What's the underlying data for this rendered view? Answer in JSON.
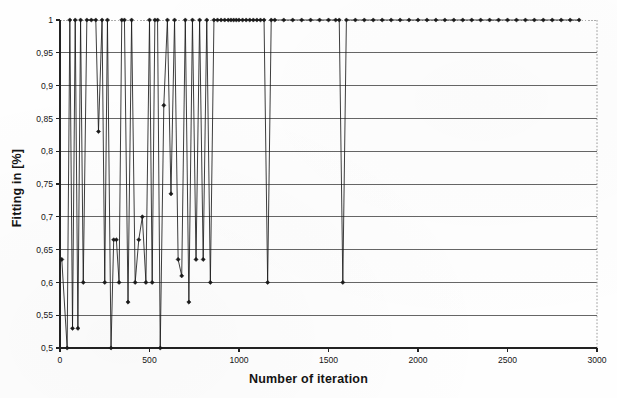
{
  "chart_data": {
    "type": "line",
    "title": "",
    "xlabel": "Number of iteration",
    "ylabel": "Fitting in [%]",
    "xlim": [
      0,
      3000
    ],
    "ylim": [
      0.5,
      1.0
    ],
    "xticks": [
      0,
      500,
      1000,
      1500,
      2000,
      2500,
      3000
    ],
    "xtick_labels": [
      "0",
      "500",
      "1000",
      "1500",
      "2000",
      "2500",
      "3000"
    ],
    "yticks": [
      0.5,
      0.55,
      0.6,
      0.65,
      0.7,
      0.75,
      0.8,
      0.85,
      0.9,
      0.95,
      1.0
    ],
    "ytick_labels": [
      "0,5",
      "0,55",
      "0,6",
      "0,65",
      "0,7",
      "0,75",
      "0,8",
      "0,85",
      "0,9",
      "0,95",
      "1"
    ],
    "decimal_separator": ",",
    "grid": "horizontal",
    "legend": "none",
    "marker": "filled-diamond",
    "line_color": "#1a1a1a",
    "grid_color": "#555555",
    "axis_color": "#222222",
    "background": "#ffffff",
    "series": [
      {
        "name": "Fitting",
        "x": [
          10,
          40,
          55,
          70,
          85,
          100,
          115,
          130,
          150,
          175,
          200,
          215,
          235,
          250,
          265,
          285,
          300,
          315,
          330,
          345,
          360,
          380,
          400,
          420,
          440,
          460,
          480,
          500,
          515,
          530,
          545,
          560,
          580,
          600,
          620,
          640,
          660,
          680,
          700,
          720,
          740,
          760,
          780,
          800,
          820,
          840,
          860,
          880,
          900,
          920,
          940,
          955,
          970,
          985,
          1000,
          1020,
          1040,
          1060,
          1080,
          1100,
          1120,
          1140,
          1160,
          1180,
          1200,
          1250,
          1300,
          1350,
          1400,
          1450,
          1500,
          1540,
          1560,
          1580,
          1600,
          1650,
          1700,
          1750,
          1800,
          1850,
          1900,
          1950,
          2000,
          2050,
          2100,
          2150,
          2200,
          2250,
          2300,
          2350,
          2400,
          2450,
          2500,
          2550,
          2600,
          2650,
          2700,
          2750,
          2800,
          2850,
          2900
        ],
        "y": [
          0.635,
          0.5,
          1.0,
          0.53,
          1.0,
          0.53,
          1.0,
          0.6,
          1.0,
          1.0,
          1.0,
          0.83,
          1.0,
          0.6,
          1.0,
          0.5,
          0.665,
          0.665,
          0.6,
          1.0,
          1.0,
          0.57,
          1.0,
          0.6,
          0.665,
          0.7,
          0.6,
          1.0,
          0.6,
          1.0,
          1.0,
          0.5,
          0.87,
          1.0,
          0.735,
          1.0,
          0.635,
          0.61,
          1.0,
          0.57,
          1.0,
          0.635,
          1.0,
          0.635,
          1.0,
          0.6,
          1.0,
          1.0,
          1.0,
          1.0,
          1.0,
          1.0,
          1.0,
          1.0,
          1.0,
          1.0,
          1.0,
          1.0,
          1.0,
          1.0,
          1.0,
          1.0,
          0.6,
          1.0,
          1.0,
          1.0,
          1.0,
          1.0,
          1.0,
          1.0,
          1.0,
          1.0,
          1.0,
          0.6,
          1.0,
          1.0,
          1.0,
          1.0,
          1.0,
          1.0,
          1.0,
          1.0,
          1.0,
          1.0,
          1.0,
          1.0,
          1.0,
          1.0,
          1.0,
          1.0,
          1.0,
          1.0,
          1.0,
          1.0,
          1.0,
          1.0,
          1.0,
          1.0,
          1.0,
          1.0,
          1.0
        ]
      }
    ]
  }
}
